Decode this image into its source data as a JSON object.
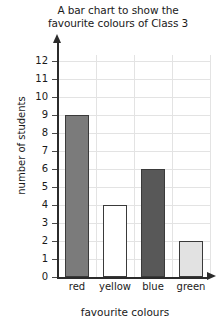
{
  "chart_data": {
    "type": "bar",
    "title": "A bar chart to show the favourite colours of Class 3",
    "title_lines": [
      "A bar chart to show the",
      "favourite colours of Class 3"
    ],
    "categories": [
      "red",
      "yellow",
      "blue",
      "green"
    ],
    "values": [
      9,
      4,
      6,
      2
    ],
    "xlabel": "favourite colours",
    "ylabel": "number of students",
    "ylim": [
      0,
      12
    ],
    "ytick_labels": [
      "12",
      "11",
      "10",
      "9",
      "8",
      "7",
      "6",
      "5",
      "4",
      "3",
      "2",
      "1",
      "0"
    ],
    "ytick_values": [
      12,
      11,
      10,
      9,
      8,
      7,
      6,
      5,
      4,
      3,
      2,
      1,
      0
    ],
    "ystep": 1,
    "grid": true,
    "legend": false,
    "bar_fills": [
      "#7b7b7b",
      "#ffffff",
      "#585858",
      "#e2e2e2"
    ],
    "bar_outline": "#3a3a3a",
    "grid_color": "#e3e3e3",
    "axis_color": "#2b2b2b",
    "background": "#ffffff"
  }
}
